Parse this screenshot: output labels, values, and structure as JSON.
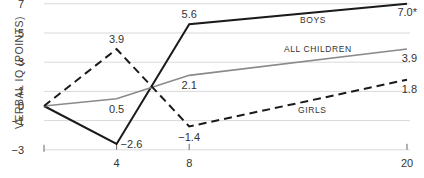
{
  "chart_data": {
    "type": "line",
    "title": "",
    "xlabel": "",
    "ylabel": "VERBAL IQ (POINTS)",
    "x": [
      0,
      4,
      8,
      20
    ],
    "x_ticks": [
      "4",
      "8",
      "20"
    ],
    "y_ticks": [
      "7",
      "5",
      "3",
      "1",
      "0",
      "−1",
      "−3"
    ],
    "y_tick_values": [
      7,
      5,
      3,
      1,
      0,
      -1,
      -3
    ],
    "ylim": [
      -3,
      7
    ],
    "grid": true,
    "series": [
      {
        "name": "BOYS",
        "style": "solid-dark",
        "values": [
          0,
          -2.6,
          5.6,
          7.0
        ],
        "labels": [
          "",
          "−2.6",
          "5.6",
          "7.0*"
        ]
      },
      {
        "name": "ALL CHILDREN",
        "style": "solid-gray",
        "values": [
          0,
          0.5,
          2.1,
          3.9
        ],
        "labels": [
          "",
          "0.5",
          "2.1",
          "3.9"
        ]
      },
      {
        "name": "GIRLS",
        "style": "dashed",
        "values": [
          0,
          3.9,
          -1.4,
          1.8
        ],
        "labels": [
          "",
          "3.9",
          "−1.4",
          "1.8"
        ]
      }
    ],
    "colors": {
      "boys": "#1a1a1a",
      "all_children": "#8a8a8a",
      "girls": "#1a1a1a",
      "grid": "#d9d9d9"
    }
  }
}
